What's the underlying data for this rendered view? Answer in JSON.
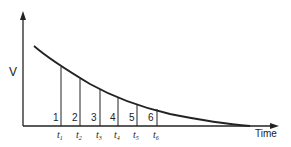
{
  "diagram": {
    "type": "decay-curve",
    "y_axis_label": "V",
    "x_axis_label": "Time",
    "colors": {
      "line": "#222222",
      "background": "#ffffff"
    },
    "segments": [
      {
        "number": "1",
        "tick": "t",
        "sub": "1",
        "x": 61,
        "top": 67
      },
      {
        "number": "2",
        "tick": "t",
        "sub": "2",
        "x": 80,
        "top": 79
      },
      {
        "number": "3",
        "tick": "t",
        "sub": "3",
        "x": 100,
        "top": 89
      },
      {
        "number": "4",
        "tick": "t",
        "sub": "4",
        "x": 118,
        "top": 97
      },
      {
        "number": "5",
        "tick": "t",
        "sub": "5",
        "x": 137,
        "top": 104
      },
      {
        "number": "6",
        "tick": "t",
        "sub": "6",
        "x": 157,
        "top": 109
      }
    ]
  }
}
